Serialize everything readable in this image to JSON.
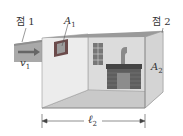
{
  "labels": {
    "point1": "점 1",
    "point2": "점 2",
    "v1": "v",
    "v1_sub": "1",
    "A1": "A",
    "A1_sub": "1",
    "A2": "A",
    "A2_sub": "2",
    "l2": "ℓ",
    "l2_sub": "2"
  },
  "colors": {
    "duct": "#a9a9a9",
    "wall_left": "#e8e8e8",
    "wall_back": "#dcdcdc",
    "wall_right": "#d6d6d6",
    "floor": "#c9c9c9",
    "ceiling_edge": "#9a9a9a",
    "brick": "#5a5a5a"
  }
}
